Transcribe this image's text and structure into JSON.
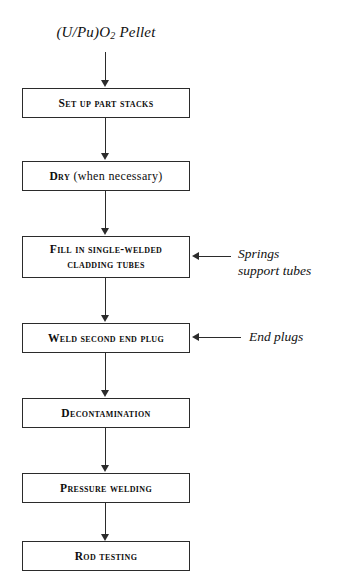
{
  "diagram": {
    "background_color": "#ffffff",
    "line_color": "#2b2b2b",
    "text_color": "#0d0d0d"
  },
  "input": {
    "label_prefix": "(U/Pu)O",
    "label_subscript": "2",
    "label_suffix": " Pellet",
    "full_text": "(U/Pu)O2 Pellet"
  },
  "steps": [
    {
      "id": "set-up-part-stacks",
      "label": "Set up part stacks",
      "lines": [
        "Set up part stacks"
      ]
    },
    {
      "id": "dry",
      "label": "Dry (when necessary)",
      "leading": "Dry",
      "trailing": " (when necessary)"
    },
    {
      "id": "fill-in-single-welded-cladding-tubes",
      "label": "Fill in single-welded cladding tubes",
      "line1": "Fill in single-welded",
      "line2": "cladding tubes"
    },
    {
      "id": "weld-second-end-plug",
      "label": "Weld second end plug",
      "lines": [
        "Weld second end plug"
      ]
    },
    {
      "id": "decontamination",
      "label": "Decontamination",
      "lines": [
        "Decontamination"
      ]
    },
    {
      "id": "pressure-welding",
      "label": "Pressure welding",
      "lines": [
        "Pressure welding"
      ]
    },
    {
      "id": "rod-testing",
      "label": "Rod testing",
      "lines": [
        "Rod testing"
      ]
    }
  ],
  "annotations": [
    {
      "id": "springs-support-tubes",
      "target": "fill-in-single-welded-cladding-tubes",
      "line1": "Springs",
      "line2": "support tubes",
      "full_text": "Springs support tubes"
    },
    {
      "id": "end-plugs",
      "target": "weld-second-end-plug",
      "line1": "End plugs",
      "full_text": "End plugs"
    }
  ]
}
